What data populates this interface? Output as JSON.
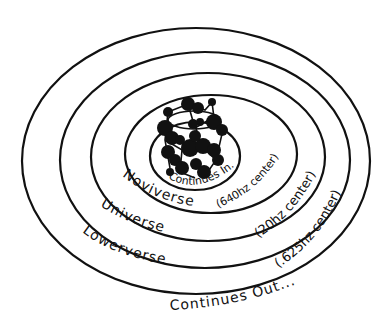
{
  "diagram": {
    "type": "concentric-nested-ellipses",
    "colors": {
      "ink": "#111111",
      "background": "#ffffff"
    },
    "center": {
      "icon": "molecule-cluster-icon",
      "label": "Continues In..."
    },
    "rings": [
      {
        "name": "Noviverse",
        "frequency_label": "(640hz center)"
      },
      {
        "name": "Universe",
        "frequency_label": "(20hz center)"
      },
      {
        "name": "Lowerverse",
        "frequency_label": "(.625hz center)"
      }
    ],
    "outer_label": "Continues Out..."
  }
}
